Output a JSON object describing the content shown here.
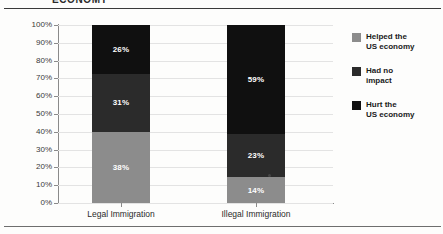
{
  "document": {
    "clipped_title": "ECONOMY"
  },
  "chart_data": {
    "type": "bar",
    "subtype": "stacked-column-100",
    "title": "",
    "xlabel": "",
    "ylabel": "",
    "ylim": [
      0,
      100
    ],
    "grid": true,
    "legend_position": "right",
    "categories": [
      "Legal Immigration",
      "Illegal Immigration"
    ],
    "ytick_labels": [
      "0%",
      "10%",
      "20%",
      "30%",
      "40%",
      "50%",
      "60%",
      "70%",
      "80%",
      "90%",
      "100%"
    ],
    "ytick_values": [
      0,
      10,
      20,
      30,
      40,
      50,
      60,
      70,
      80,
      90,
      100
    ],
    "series": [
      {
        "name": "Helped the US economy",
        "color": "#8c8c8c",
        "values": [
          38,
          14
        ],
        "labels": [
          "38%",
          "14%"
        ]
      },
      {
        "name": "Had no impact",
        "color": "#2b2b2b",
        "values": [
          31,
          23
        ],
        "labels": [
          "31%",
          "23%"
        ]
      },
      {
        "name": "Hurt the US economy",
        "color": "#101010",
        "values": [
          26,
          59
        ],
        "labels": [
          "26%",
          "59%"
        ]
      }
    ]
  },
  "legend": {
    "items": [
      {
        "line1": "Helped the",
        "line2": "US economy",
        "color": "#8c8c8c"
      },
      {
        "line1": "Had no",
        "line2": "impact",
        "color": "#2b2b2b"
      },
      {
        "line1": "Hurt the",
        "line2": "US economy",
        "color": "#101010"
      }
    ]
  },
  "axis": {
    "y_labels": [
      "100%",
      "90%",
      "80%",
      "70%",
      "60%",
      "50%",
      "40%",
      "30%",
      "20%",
      "10%",
      "0%"
    ]
  }
}
